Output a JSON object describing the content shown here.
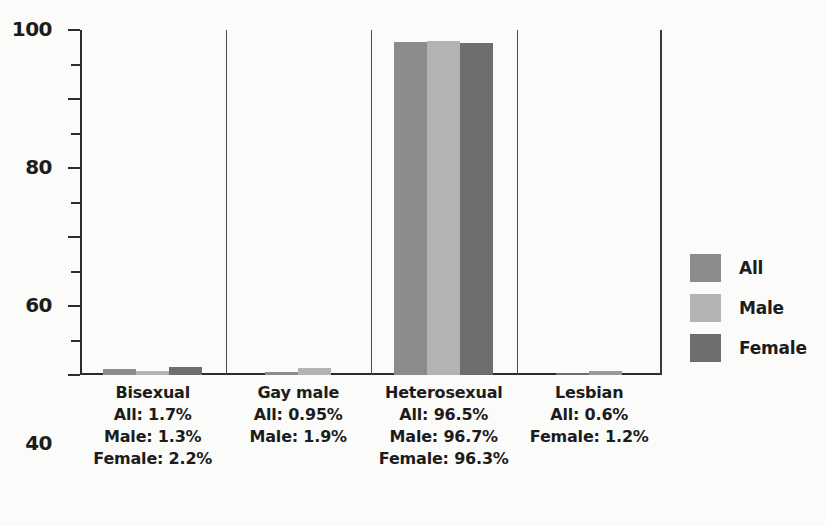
{
  "chart_data": {
    "type": "bar",
    "title": "",
    "xlabel": "",
    "ylabel": "",
    "ylim": [
      0,
      100
    ],
    "grid": false,
    "legend_position": "right",
    "categories": [
      "Bisexual",
      "Gay male",
      "Heterosexual",
      "Lesbian"
    ],
    "series": [
      {
        "name": "All",
        "color": "#8b8b8b",
        "values": [
          1.7,
          0.95,
          96.5,
          0.6
        ]
      },
      {
        "name": "Male",
        "color": "#b3b3b3",
        "values": [
          1.3,
          1.9,
          96.7,
          null
        ]
      },
      {
        "name": "Female",
        "color": "#6e6e6e",
        "values": [
          2.2,
          null,
          96.3,
          1.2
        ]
      }
    ],
    "y_ticks_major": [
      0,
      20,
      40,
      60,
      80,
      100
    ],
    "y_ticks_minor": [
      10,
      30,
      50,
      70,
      90
    ],
    "groups": [
      {
        "category": "Bisexual",
        "stats": [
          "All: 1.7%",
          "Male: 1.3%",
          "Female: 2.2%"
        ],
        "bars": [
          {
            "series": "All",
            "value": 1.7,
            "color": "#8b8b8b"
          },
          {
            "series": "Male",
            "value": 1.3,
            "color": "#b3b3b3"
          },
          {
            "series": "Female",
            "value": 2.2,
            "color": "#6e6e6e"
          }
        ]
      },
      {
        "category": "Gay male",
        "stats": [
          "All: 0.95%",
          "Male: 1.9%"
        ],
        "bars": [
          {
            "series": "All",
            "value": 0.95,
            "color": "#8b8b8b"
          },
          {
            "series": "Male",
            "value": 1.9,
            "color": "#b3b3b3"
          }
        ]
      },
      {
        "category": "Heterosexual",
        "stats": [
          "All: 96.5%",
          "Male: 96.7%",
          "Female: 96.3%"
        ],
        "bars": [
          {
            "series": "All",
            "value": 96.5,
            "color": "#8b8b8b"
          },
          {
            "series": "Male",
            "value": 96.7,
            "color": "#b3b3b3"
          },
          {
            "series": "Female",
            "value": 96.3,
            "color": "#6e6e6e"
          }
        ]
      },
      {
        "category": "Lesbian",
        "stats": [
          "All: 0.6%",
          "Female: 1.2%"
        ],
        "bars": [
          {
            "series": "All",
            "value": 0.6,
            "color": "#6e6e6e"
          },
          {
            "series": "Female",
            "value": 1.2,
            "color": "#9a9a9a"
          }
        ]
      }
    ],
    "legend": [
      {
        "label": "All",
        "color": "#8b8b8b"
      },
      {
        "label": "Male",
        "color": "#b3b3b3"
      },
      {
        "label": "Female",
        "color": "#6e6e6e"
      }
    ]
  },
  "axis": {
    "y_labels": [
      "100",
      "80",
      "60",
      "40",
      "20",
      "0"
    ]
  },
  "colors": {
    "background": "#fbfbfa",
    "axis": "#2b2b2b",
    "text": "#1c1c1c",
    "separator": "#4a4a4a"
  }
}
